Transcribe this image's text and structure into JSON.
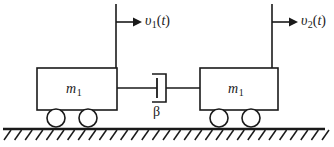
{
  "figure": {
    "background_color": "#ffffff",
    "stroke_color": "#1a1a1a"
  },
  "masses": [
    {
      "id": "mass-left",
      "symbol": "m",
      "subscript": "1",
      "wheel_count": 2
    },
    {
      "id": "mass-right",
      "symbol": "m",
      "subscript": "1",
      "wheel_count": 2
    }
  ],
  "velocities": [
    {
      "id": "velocity-left",
      "symbol": "υ",
      "subscript": "1",
      "argument": "t",
      "open_paren": "(",
      "close_paren": ")",
      "direction": "right"
    },
    {
      "id": "velocity-right",
      "symbol": "υ",
      "subscript": "2",
      "argument": "t",
      "open_paren": "(",
      "close_paren": ")",
      "direction": "right"
    }
  ],
  "damper": {
    "id": "damper",
    "label": "β",
    "type": "viscous-damper"
  },
  "ground": {
    "id": "ground",
    "hatch_direction": "up-right",
    "hatch_count": 30
  }
}
